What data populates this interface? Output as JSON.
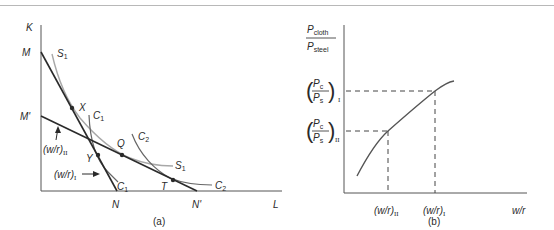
{
  "panel_a": {
    "caption": "(a)",
    "axis_y_label": "K",
    "axis_x_label": "L",
    "intercepts": {
      "M": "M",
      "M_prime": "M'",
      "N": "N",
      "N_prime": "N'"
    },
    "isoquants": {
      "S1_top": "S",
      "S1_top_sub": "1",
      "S1_right": "S",
      "S1_right_sub": "1",
      "C1_top": "C",
      "C1_top_sub": "1",
      "C1_bottom": "C",
      "C1_bottom_sub": "1",
      "C2_top": "C",
      "C2_top_sub": "2",
      "C2_right": "C",
      "C2_right_sub": "2"
    },
    "points": {
      "X": "X",
      "Y": "Y",
      "Q": "Q",
      "T": "T"
    },
    "arrows": {
      "wr_II": "(w/r)",
      "wr_II_sub": "II",
      "wr_I": "(w/r)",
      "wr_I_sub": "I"
    }
  },
  "panel_b": {
    "caption": "(b)",
    "y_label_num": "P",
    "y_label_num_sub": "cloth",
    "y_label_den": "P",
    "y_label_den_sub": "steel",
    "x_label": "w/r",
    "tick_y_I": {
      "num": "P",
      "num_sub": "c",
      "den": "P",
      "den_sub": "s",
      "regime": "I"
    },
    "tick_y_II": {
      "num": "P",
      "num_sub": "c",
      "den": "P",
      "den_sub": "s",
      "regime": "II"
    },
    "tick_x_II": "(w/r)",
    "tick_x_II_sub": "II",
    "tick_x_I": "(w/r)",
    "tick_x_I_sub": "I"
  },
  "colors": {
    "line": "#2a2a2a",
    "curve": "#555555",
    "light_curve": "#a8a8a8",
    "axis": "#555555"
  }
}
